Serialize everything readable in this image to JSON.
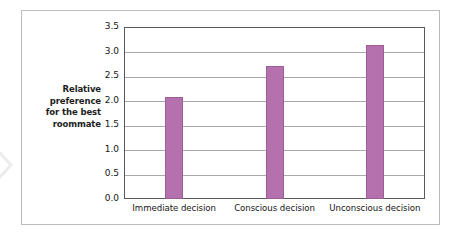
{
  "chart_data": {
    "type": "bar",
    "title": "",
    "xlabel": "",
    "ylabel": "Relative preference for the best roommate",
    "ylabel_lines": [
      "Relative",
      "preference",
      "for the best",
      "roommate"
    ],
    "categories": [
      "Immediate decision",
      "Conscious decision",
      "Unconscious decision"
    ],
    "values": [
      2.08,
      2.71,
      3.13
    ],
    "series": [
      {
        "name": "Relative preference for the best roommate",
        "values": [
          2.08,
          2.71,
          3.13
        ]
      }
    ],
    "ylim": [
      0.0,
      3.5
    ],
    "ytick_labels": [
      "0.0",
      "0.5",
      "1.0",
      "1.5",
      "2.0",
      "2.5",
      "3.0",
      "3.5"
    ],
    "ytick_values": [
      0.0,
      0.5,
      1.0,
      1.5,
      2.0,
      2.5,
      3.0,
      3.5
    ],
    "grid": "horizontal",
    "legend": "none",
    "bar_color": "#b571ae",
    "bar_border_color": "#9d5e97",
    "gridline_color": "#a8a9ad",
    "axis_color": "#58595b",
    "frame_color": "#b9bcc0",
    "text_color": "#161616",
    "background_color": "#ffffff"
  }
}
